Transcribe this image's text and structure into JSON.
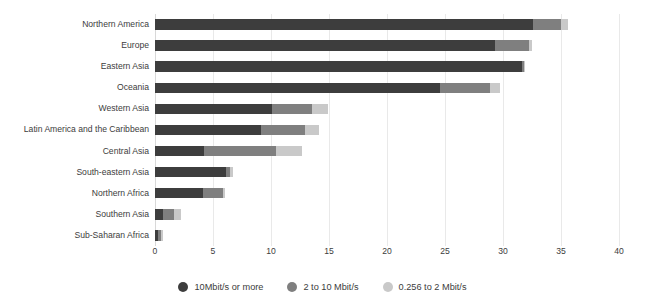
{
  "chart_data": {
    "type": "bar",
    "orientation": "horizontal",
    "stacked": true,
    "title": "",
    "subtitle": "",
    "xlabel": "",
    "ylabel": "",
    "xlim": [
      0,
      40
    ],
    "xticks": [
      0,
      5,
      10,
      15,
      20,
      25,
      30,
      35,
      40
    ],
    "xtick_labels": [
      "0",
      "5",
      "10",
      "15",
      "20",
      "25",
      "30",
      "35",
      "40"
    ],
    "grid": true,
    "grid_axis": "x",
    "legend_position": "bottom-center",
    "categories": [
      "Northern America",
      "Europe",
      "Eastern Asia",
      "Oceania",
      "Western Asia",
      "Latin America and the Caribbean",
      "Central Asia",
      "South-eastern Asia",
      "Northern Africa",
      "Southern Asia",
      "Sub-Saharan Africa"
    ],
    "series": [
      {
        "name": "10Mbit/s or more",
        "color": "#3d3d3d",
        "values": [
          32.6,
          29.3,
          31.6,
          24.6,
          10.1,
          9.1,
          4.2,
          6.1,
          4.1,
          0.7,
          0.3
        ]
      },
      {
        "name": "2 to 10 Mbit/s",
        "color": "#7f7f7f",
        "values": [
          2.4,
          2.9,
          0.2,
          4.3,
          3.4,
          3.8,
          6.2,
          0.4,
          1.8,
          0.9,
          0.2
        ]
      },
      {
        "name": "0.256 to 2 Mbit/s",
        "color": "#c9c9c9",
        "values": [
          0.6,
          0.3,
          0.1,
          0.8,
          1.4,
          1.2,
          2.3,
          0.2,
          0.1,
          0.6,
          0.2
        ]
      }
    ],
    "totals": [
      35.6,
      32.5,
      31.9,
      29.7,
      14.9,
      14.1,
      12.7,
      6.7,
      6.0,
      2.2,
      0.7
    ]
  },
  "legend": {
    "items": [
      {
        "label": "10Mbit/s or more",
        "color": "#3d3d3d"
      },
      {
        "label": "2 to 10 Mbit/s",
        "color": "#7f7f7f"
      },
      {
        "label": "0.256 to 2 Mbit/s",
        "color": "#c9c9c9"
      }
    ]
  }
}
